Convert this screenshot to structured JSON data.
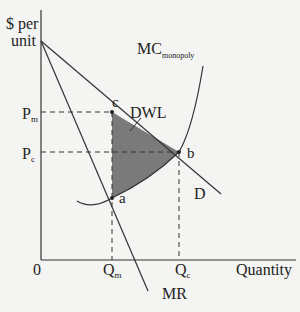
{
  "diagram": {
    "type": "monopoly deadweight loss",
    "y_axis_label_line1": "$ per",
    "y_axis_label_line2": "unit",
    "x_axis_label": "Quantity",
    "origin_label": "0",
    "price_labels": {
      "pm_main": "P",
      "pm_sub": "m",
      "pc_main": "P",
      "pc_sub": "c"
    },
    "quantity_labels": {
      "qm_main": "Q",
      "qm_sub": "m",
      "qc_main": "Q",
      "qc_sub": "c"
    },
    "curves": {
      "mc_main": "MC",
      "mc_sub": "monopoly",
      "demand": "D",
      "marginal_revenue": "MR"
    },
    "points": {
      "c": "c",
      "b": "b",
      "a": "a"
    },
    "area_label": "DWL",
    "colors": {
      "background": "#f4f4f2",
      "lines": "#333333",
      "dwl_fill": "#7a7a7a"
    }
  }
}
